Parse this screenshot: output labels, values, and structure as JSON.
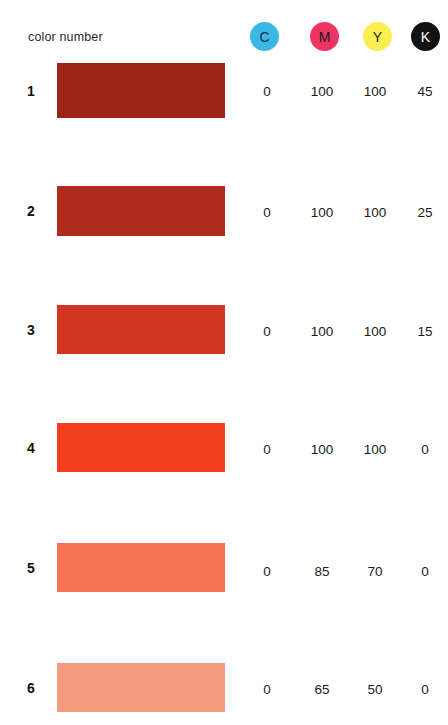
{
  "header": {
    "row_label": "color number",
    "ink_channels": [
      {
        "key": "C",
        "label": "C",
        "name": "cyan",
        "dot_color": "#3CB6E3",
        "text_color": "#14323f",
        "x": 250
      },
      {
        "key": "M",
        "label": "M",
        "name": "magenta",
        "dot_color": "#EE3465",
        "text_color": "#1a1a1a",
        "x": 310
      },
      {
        "key": "Y",
        "label": "Y",
        "name": "yellow",
        "dot_color": "#FBEE52",
        "text_color": "#1a1a1a",
        "x": 363
      },
      {
        "key": "K",
        "label": "K",
        "name": "black",
        "dot_color": "#121212",
        "text_color": "#ffffff",
        "x": 411
      }
    ]
  },
  "columns": {
    "number_header": "color number",
    "value_x": [
      250,
      305,
      358,
      408
    ]
  },
  "rows": [
    {
      "number": "1",
      "swatch_color": "#9C2317",
      "swatch_top": 63,
      "swatch_height": 55,
      "value_y": 85,
      "values": {
        "C": "0",
        "M": "100",
        "Y": "100",
        "K": "45"
      }
    },
    {
      "number": "2",
      "swatch_color": "#AF2B1B",
      "swatch_top": 186,
      "swatch_height": 50,
      "value_y": 206,
      "values": {
        "C": "0",
        "M": "100",
        "Y": "100",
        "K": "25"
      }
    },
    {
      "number": "3",
      "swatch_color": "#D03622",
      "swatch_top": 305,
      "swatch_height": 49,
      "value_y": 325,
      "values": {
        "C": "0",
        "M": "100",
        "Y": "100",
        "K": "15"
      }
    },
    {
      "number": "4",
      "swatch_color": "#F4401F",
      "swatch_top": 423,
      "swatch_height": 49,
      "value_y": 443,
      "values": {
        "C": "0",
        "M": "100",
        "Y": "100",
        "K": "0"
      }
    },
    {
      "number": "5",
      "swatch_color": "#F67353",
      "swatch_top": 543,
      "swatch_height": 49,
      "value_y": 565,
      "values": {
        "C": "0",
        "M": "85",
        "Y": "70",
        "K": "0"
      }
    },
    {
      "number": "6",
      "swatch_color": "#F69B7F",
      "swatch_top": 663,
      "swatch_height": 49,
      "value_y": 683,
      "values": {
        "C": "0",
        "M": "65",
        "Y": "50",
        "K": "0"
      }
    }
  ],
  "chart_data": {
    "type": "table",
    "title": "",
    "xlabel": "",
    "ylabel": "",
    "categories": [
      "1",
      "2",
      "3",
      "4",
      "5",
      "6"
    ],
    "column_headers": [
      "color number",
      "C",
      "M",
      "Y",
      "K"
    ],
    "series": [
      {
        "name": "C",
        "values": [
          0,
          0,
          0,
          0,
          0,
          0
        ]
      },
      {
        "name": "M",
        "values": [
          100,
          100,
          100,
          100,
          85,
          65
        ]
      },
      {
        "name": "Y",
        "values": [
          100,
          100,
          100,
          100,
          70,
          50
        ]
      },
      {
        "name": "K",
        "values": [
          45,
          25,
          15,
          0,
          0,
          0
        ]
      }
    ],
    "swatch_colors": [
      "#9C2317",
      "#AF2B1B",
      "#D03622",
      "#F4401F",
      "#F67353",
      "#F69B7F"
    ],
    "legend_position": "top-right",
    "grid": false
  }
}
